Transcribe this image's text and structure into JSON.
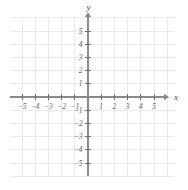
{
  "figure": {
    "kind": "cartesian-coordinate-grid",
    "title": "",
    "background_color": "#ffffff",
    "grid_color": "#e9e9e9",
    "axis_color": "#8a8a8a",
    "tick_color": "#6f6f6f",
    "label_color": "#5e5e5e",
    "axis_label_color": "#4a4a4a"
  },
  "axes": {
    "x": {
      "name": "x",
      "min": -6,
      "max": -6,
      "tick_values": [
        -5,
        -4,
        -3,
        -2,
        -1,
        1,
        2,
        3,
        4,
        5
      ],
      "tick_labels": [
        "−5",
        "−4",
        "−3",
        "−2",
        "−1",
        "1",
        "2",
        "3",
        "4",
        "5"
      ],
      "has_arrow": true,
      "arrow_direction": "right"
    },
    "y": {
      "name": "y",
      "min": -6,
      "max": 6,
      "tick_values": [
        5,
        4,
        3,
        2,
        1,
        -1,
        -2,
        -3,
        -4,
        -5
      ],
      "tick_labels": [
        "5",
        "4",
        "3",
        "2",
        "1",
        "−1",
        "−2",
        "−3",
        "−4",
        "−5"
      ],
      "has_arrow": true,
      "arrow_direction": "up"
    }
  },
  "geometry": {
    "origin_x": 88,
    "origin_y": 97,
    "unit_px": 13.2,
    "grid_left": 10,
    "grid_right": 175,
    "grid_top": 18,
    "grid_bottom": 176,
    "x_arrow_tip": 164,
    "y_arrow_tip": 17
  },
  "plotted": {
    "points": [],
    "curves": [],
    "note": ""
  }
}
